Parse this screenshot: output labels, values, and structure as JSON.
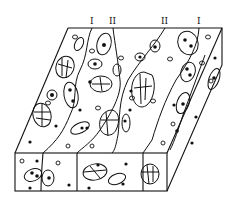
{
  "figure": {
    "caption_cutoff": "",
    "zone_labels": [
      {
        "text": "I",
        "x": 92,
        "y": 24
      },
      {
        "text": "II",
        "x": 113,
        "y": 24
      },
      {
        "text": "II",
        "x": 165,
        "y": 24
      },
      {
        "text": "I",
        "x": 199,
        "y": 24
      }
    ],
    "colors": {
      "line": "#111111",
      "background": "#ffffff"
    }
  }
}
